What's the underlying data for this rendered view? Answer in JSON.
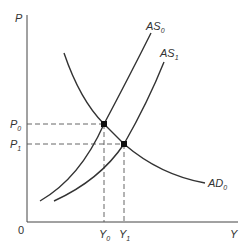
{
  "diagram": {
    "type": "AS-AD shift",
    "axes": {
      "y_label": "P",
      "x_label": "Y",
      "origin_label": "0"
    },
    "curves": [
      {
        "name": "AS",
        "subscript": "0",
        "role": "aggregate supply (initial)"
      },
      {
        "name": "AS",
        "subscript": "1",
        "role": "aggregate supply (shifted right)"
      },
      {
        "name": "AD",
        "subscript": "0",
        "role": "aggregate demand"
      }
    ],
    "equilibria": [
      {
        "price_label": "P",
        "price_sub": "0",
        "output_label": "Y",
        "output_sub": "0"
      },
      {
        "price_label": "P",
        "price_sub": "1",
        "output_label": "Y",
        "output_sub": "1"
      }
    ],
    "colors": {
      "line": "#333333",
      "dash": "#555555",
      "background": "#ffffff"
    }
  }
}
